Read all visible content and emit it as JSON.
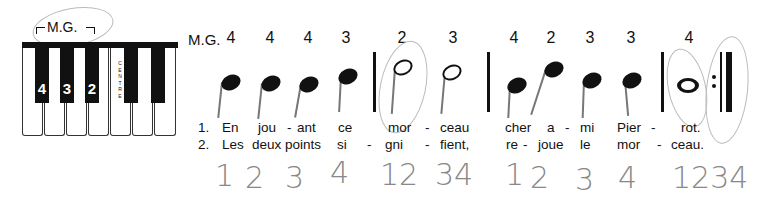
{
  "keyboard": {
    "hand_label": "M.G.",
    "centre_label": "CENTRE",
    "black_key_fingers": [
      "4",
      "3",
      "2"
    ],
    "white_keys": 7,
    "black_keys": 5
  },
  "score": {
    "hand_label": "M.G.",
    "fingerings": [
      "4",
      "4",
      "4",
      "3",
      "2",
      "3",
      "4",
      "2",
      "3",
      "3",
      "4"
    ],
    "note_types": [
      "quarter",
      "quarter",
      "quarter",
      "quarter",
      "half",
      "half",
      "quarter",
      "quarter",
      "quarter",
      "quarter",
      "whole"
    ],
    "verse1": {
      "number": "1.",
      "syllables": [
        "En",
        "jou",
        "-",
        "ant",
        "ce",
        "mor",
        "-",
        "ceau",
        "cher",
        "a",
        "-",
        "mi",
        "Pier",
        "-",
        "rot."
      ]
    },
    "verse2": {
      "number": "2.",
      "syllables": [
        "Les",
        "deux points",
        "si",
        "-",
        "gni",
        "-",
        "fient,",
        "re",
        "-",
        "joue",
        "le",
        "mor",
        "-",
        "ceau."
      ]
    },
    "handwritten_counts": [
      "1",
      "2",
      "3",
      "4",
      "12",
      "34",
      "1",
      "2",
      "3",
      "4",
      "1234"
    ]
  }
}
